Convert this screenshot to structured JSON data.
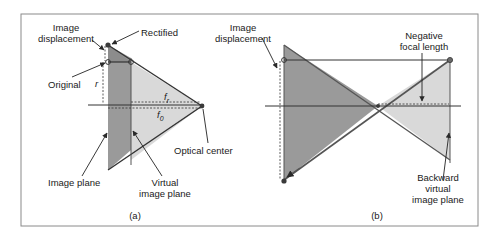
{
  "figure": {
    "panel_a": {
      "caption": "(a)",
      "labels": {
        "image_displacement_line1": "Image",
        "image_displacement_line2": "displacement",
        "rectified": "Rectified",
        "original": "Original",
        "r": "r",
        "f_r_base": "f",
        "f_r_sub": "r",
        "f_0_base": "f",
        "f_0_sub": "0",
        "optical_center": "Optical center",
        "image_plane": "Image plane",
        "virtual_image_plane_line1": "Virtual",
        "virtual_image_plane_line2": "image plane"
      }
    },
    "panel_b": {
      "caption": "(b)",
      "labels": {
        "image_displacement_line1": "Image",
        "image_displacement_line2": "displacement",
        "negative_focal_length_line1": "Negative",
        "negative_focal_length_line2": "focal length",
        "backward_line1": "Backward",
        "backward_line2": "virtual",
        "backward_line3": "image plane"
      }
    },
    "colors": {
      "frame": "#8a8a8a",
      "dark_fill": "#9a9a9a",
      "light_fill": "#d9d9d9",
      "line": "#333333",
      "point": "#3a3a3a",
      "arrow_fill": "#555555"
    }
  }
}
